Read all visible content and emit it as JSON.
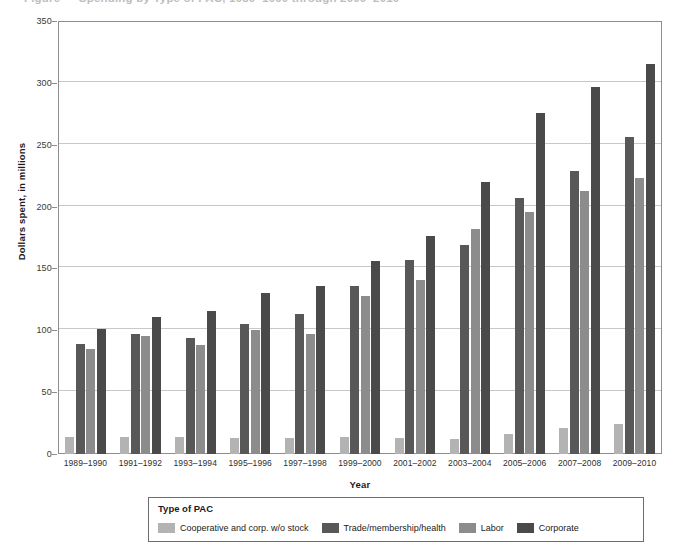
{
  "figure": {
    "cut_off_title": "Figure — Spending by Type of PAC, 1989–1990 through 2009–2010"
  },
  "chart_data": {
    "type": "bar",
    "title": "",
    "xlabel": "Year",
    "ylabel": "Dollars spent, in millions",
    "ylim": [
      0,
      350
    ],
    "yticks": [
      0,
      50,
      100,
      150,
      200,
      250,
      300,
      350
    ],
    "grid": true,
    "legend_position": "bottom",
    "legend_title": "Type of PAC",
    "categories": [
      "1989–1990",
      "1991–1992",
      "1993–1994",
      "1995–1996",
      "1997–1998",
      "1999–2000",
      "2001–2002",
      "2003–2004",
      "2005–2006",
      "2007–2008",
      "2009–2010"
    ],
    "series": [
      {
        "name": "Cooperative and corp. w/o stock",
        "color": "#b3b3b3",
        "values": [
          14,
          14,
          14,
          13,
          13,
          14,
          13,
          12,
          16,
          21,
          24
        ]
      },
      {
        "name": "Trade/membership/health",
        "color": "#585858",
        "values": [
          89,
          97,
          94,
          105,
          113,
          136,
          157,
          169,
          207,
          229,
          256
        ]
      },
      {
        "name": "Labor",
        "color": "#8c8c8c",
        "values": [
          85,
          95,
          88,
          100,
          97,
          128,
          141,
          182,
          196,
          213,
          223
        ]
      },
      {
        "name": "Corporate",
        "color": "#4a4a4a",
        "values": [
          101,
          111,
          116,
          130,
          136,
          156,
          176,
          220,
          276,
          297,
          315
        ]
      }
    ]
  }
}
